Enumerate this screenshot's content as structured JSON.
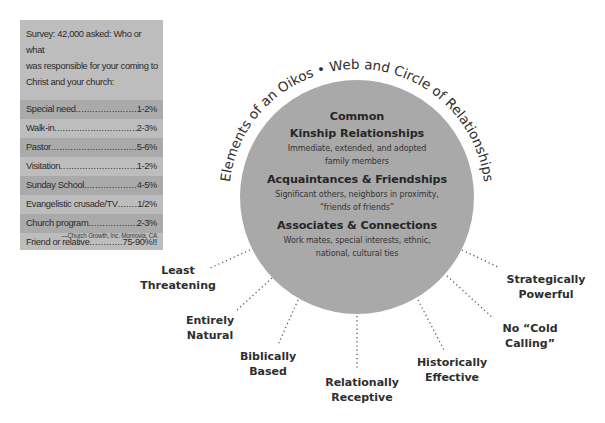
{
  "survey": {
    "intro": "Survey: 42,000 asked: Who or what was responsible for your coming to Christ and your church:",
    "intro_lines": [
      "Survey: 42,000 asked: Who or what",
      "was responsible for your coming to",
      "Christ and your church:"
    ],
    "rows": [
      {
        "label": "Special need",
        "value": "1-2%"
      },
      {
        "label": "Walk-in",
        "value": "2-3%"
      },
      {
        "label": "Pastor",
        "value": "5-6%"
      },
      {
        "label": "Visitation",
        "value": "1-2%"
      },
      {
        "label": "Sunday School",
        "value": "4-5%"
      },
      {
        "label": "Evangelistic crusade/TV",
        "value": "1/2%"
      },
      {
        "label": "Church program",
        "value": "2-3%"
      },
      {
        "label": "Friend or relative",
        "value": "75-90%!!"
      }
    ],
    "source": "—Church Growth, Inc.  Monrovia, CA"
  },
  "diagram": {
    "arc_title": "Elements of an Oikos • Web and Circle of Relationships",
    "circle_color": "#a9a9a9",
    "sections": [
      {
        "heading_line1": "Common",
        "heading_line2": "Kinship Relationships",
        "desc_line1": "Immediate, extended, and adopted",
        "desc_line2": "family members"
      },
      {
        "heading": "Acquaintances & Friendships",
        "desc_line1": "Significant others, neighbors in proximity,",
        "desc_line2": "“friends of friends”"
      },
      {
        "heading": "Associates & Connections",
        "desc_line1": "Work mates, special interests, ethnic,",
        "desc_line2": "national, cultural ties"
      }
    ],
    "spokes": [
      {
        "line1": "Least",
        "line2": "Threatening"
      },
      {
        "line1": "Entirely",
        "line2": "Natural"
      },
      {
        "line1": "Biblically",
        "line2": "Based"
      },
      {
        "line1": "Relationally",
        "line2": "Receptive"
      },
      {
        "line1": "Historically",
        "line2": "Effective"
      },
      {
        "line1": "No “Cold",
        "line2": "Calling”"
      },
      {
        "line1": "Strategically",
        "line2": "Powerful"
      }
    ]
  }
}
